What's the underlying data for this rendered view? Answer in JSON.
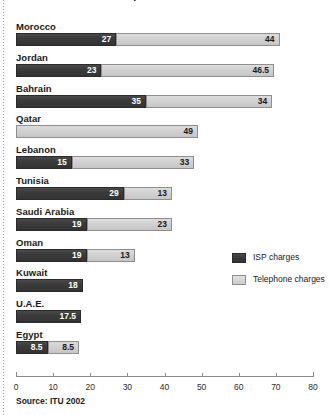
{
  "figure": {
    "title": "Internet access costs per month in US$",
    "source_note": "Source: ITU 2002"
  },
  "legend": {
    "position": "right-middle",
    "items": [
      {
        "label": "ISP charges",
        "color": "#3b3b3b",
        "key": "isp"
      },
      {
        "label": "Telephone charges",
        "color": "#d2d2d2",
        "key": "telephone"
      }
    ]
  },
  "axis": {
    "min": 0,
    "max": 80,
    "step": 10,
    "ticks": [
      "0",
      "10",
      "20",
      "30",
      "40",
      "50",
      "60",
      "70",
      "80"
    ]
  },
  "chart_data": {
    "type": "bar",
    "orientation": "horizontal",
    "stacked": true,
    "title": "Internet access costs per month in US$",
    "subtitle": "",
    "xlabel": "",
    "ylabel": "",
    "xlim": [
      0,
      80
    ],
    "grid": false,
    "legend_position": "right-middle",
    "categories": [
      "Morocco",
      "Jordan",
      "Bahrain",
      "Qatar",
      "Lebanon",
      "Tunisia",
      "Saudi Arabia",
      "Oman",
      "Kuwait",
      "U.A.E.",
      "Egypt"
    ],
    "series": [
      {
        "name": "ISP charges",
        "color": "#3b3b3b",
        "values": [
          27,
          23,
          35,
          0,
          15,
          29,
          19,
          19,
          18,
          17.5,
          8.5
        ],
        "labels": [
          "27",
          "23",
          "35",
          "",
          "15",
          "29",
          "19",
          "19",
          "18",
          "17.5",
          "8.5"
        ]
      },
      {
        "name": "Telephone charges",
        "color": "#d2d2d2",
        "values": [
          44,
          46.5,
          34,
          49,
          33,
          13,
          23,
          13,
          0,
          0,
          8.5
        ],
        "labels": [
          "44",
          "46.5",
          "34",
          "49",
          "33",
          "13",
          "23",
          "13",
          "",
          "",
          "8.5"
        ]
      }
    ],
    "totals": [
      71,
      69.5,
      69,
      49,
      48,
      42,
      42,
      32,
      18,
      17.5,
      17
    ]
  },
  "rows": [
    {
      "label": "Morocco",
      "isp": 27,
      "isp_label": "27",
      "tel": 44,
      "tel_label": "44"
    },
    {
      "label": "Jordan",
      "isp": 23,
      "isp_label": "23",
      "tel": 46.5,
      "tel_label": "46.5"
    },
    {
      "label": "Bahrain",
      "isp": 35,
      "isp_label": "35",
      "tel": 34,
      "tel_label": "34"
    },
    {
      "label": "Qatar",
      "isp": 0,
      "isp_label": "",
      "tel": 49,
      "tel_label": "49"
    },
    {
      "label": "Lebanon",
      "isp": 15,
      "isp_label": "15",
      "tel": 33,
      "tel_label": "33"
    },
    {
      "label": "Tunisia",
      "isp": 29,
      "isp_label": "29",
      "tel": 13,
      "tel_label": "13"
    },
    {
      "label": "Saudi Arabia",
      "isp": 19,
      "isp_label": "19",
      "tel": 23,
      "tel_label": "23"
    },
    {
      "label": "Oman",
      "isp": 19,
      "isp_label": "19",
      "tel": 13,
      "tel_label": "13"
    },
    {
      "label": "Kuwait",
      "isp": 18,
      "isp_label": "18",
      "tel": 0,
      "tel_label": ""
    },
    {
      "label": "U.A.E.",
      "isp": 17.5,
      "isp_label": "17.5",
      "tel": 0,
      "tel_label": ""
    },
    {
      "label": "Egypt",
      "isp": 8.5,
      "isp_label": "8.5",
      "tel": 8.5,
      "tel_label": "8.5"
    }
  ]
}
